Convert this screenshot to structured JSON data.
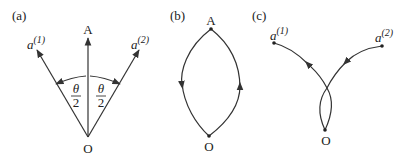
{
  "panels": {
    "a": {
      "label": "(a)",
      "point_top": "A",
      "point_origin": "O",
      "vec1_base": "a",
      "vec1_sup": "(1)",
      "vec2_base": "a",
      "vec2_sup": "(2)",
      "angle_num": "θ",
      "angle_den": "2"
    },
    "b": {
      "label": "(b)",
      "point_top": "A",
      "point_origin": "O"
    },
    "c": {
      "label": "(c)",
      "vec1_base": "a",
      "vec1_sup": "(1)",
      "vec2_base": "a",
      "vec2_sup": "(2)",
      "point_origin": "O"
    }
  }
}
